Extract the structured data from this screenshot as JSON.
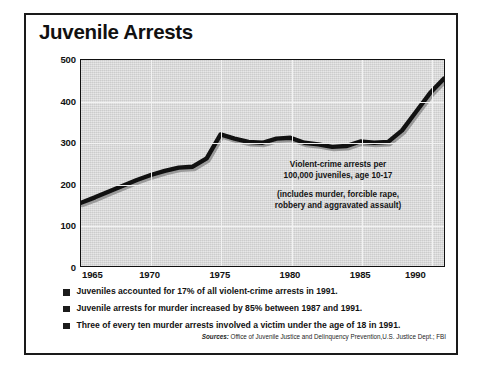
{
  "figure": {
    "title": "Juvenile Arrests"
  },
  "annotation": {
    "line1": "Violent-crime arrests per",
    "line2": "100,000 juveniles, age 10-17",
    "line3": "(includes murder, forcible rape,",
    "line4": "robbery and aggravated assault)"
  },
  "bullets": [
    {
      "text": "Juveniles accounted for 17% of all violent-crime arrests in 1991."
    },
    {
      "text": "Juvenile arrests for murder increased by 85% between 1987 and 1991."
    },
    {
      "text": "Three of every ten murder arrests involved a victim under the age of 18 in 1991."
    }
  ],
  "sources": {
    "lead": "Sources:",
    "text": " Office of Juvenile Justice and Delinquency Prevention,U.S. Justice Dept.; FBI"
  },
  "colors": {
    "plot_background": "#d8d8d8",
    "series_line": "#111111",
    "frame": "#1a1a1a",
    "gridline": "#f2f2f2",
    "text": "#121212"
  },
  "chart_data": {
    "type": "line",
    "title": "Juvenile Arrests",
    "xlabel": "",
    "ylabel": "",
    "ylim": [
      0,
      500
    ],
    "xlim": [
      1965,
      1991
    ],
    "yticks": [
      0,
      100,
      200,
      300,
      400,
      500
    ],
    "xticks": [
      1965,
      1970,
      1975,
      1980,
      1985,
      1990
    ],
    "grid": true,
    "legend": null,
    "annotations": [
      "Violent-crime arrests per 100,000 juveniles, age 10-17",
      "(includes murder, forcible rape, robbery and aggravated assault)"
    ],
    "x": [
      1965,
      1966,
      1967,
      1968,
      1969,
      1970,
      1971,
      1972,
      1973,
      1974,
      1975,
      1976,
      1977,
      1978,
      1979,
      1980,
      1981,
      1982,
      1983,
      1984,
      1985,
      1986,
      1987,
      1988,
      1989,
      1990,
      1991
    ],
    "series": [
      {
        "name": "Violent-crime arrests per 100,000 juveniles age 10-17",
        "values": [
          155,
          168,
          182,
          196,
          210,
          222,
          232,
          240,
          242,
          262,
          320,
          310,
          302,
          300,
          310,
          312,
          300,
          296,
          290,
          292,
          303,
          300,
          302,
          330,
          375,
          420,
          455
        ]
      }
    ]
  }
}
